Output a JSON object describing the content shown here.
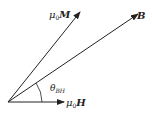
{
  "diagram": {
    "title": "",
    "vectors": [
      {
        "id": "M",
        "label_prefix": "μ",
        "label_sub": "0",
        "label_main": "M",
        "from": [
          8,
          102
        ],
        "to": [
          80,
          12
        ]
      },
      {
        "id": "B",
        "label_main": "B",
        "from": [
          8,
          102
        ],
        "to": [
          138,
          14
        ]
      },
      {
        "id": "H",
        "label_prefix": "μ",
        "label_sub": "0",
        "label_main": "H",
        "from": [
          8,
          102
        ],
        "to": [
          64,
          102
        ]
      }
    ],
    "angle": {
      "label": "θ",
      "label_sub": "BH",
      "between": [
        "B",
        "H"
      ]
    },
    "colors": {
      "stroke": "#222222"
    }
  }
}
